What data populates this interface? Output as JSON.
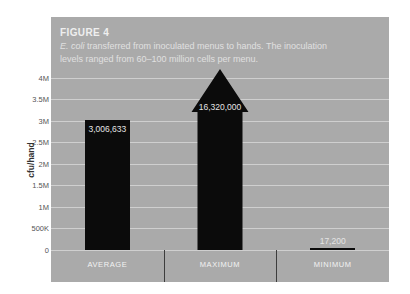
{
  "figure": {
    "label": "FIGURE 4",
    "caption_line1_italic": "E. coli",
    "caption_line1_rest": " transferred from inoculated menus to hands. The inoculation",
    "caption_line2": "levels ranged from 60–100 million cells per menu."
  },
  "colors": {
    "panel_background": "#aaaaaa",
    "bar": "#0b0b0b",
    "gridline": "#cfcfcf",
    "title_text": "#efefef",
    "axis_text": "#555555",
    "divider": "#3d3d3d"
  },
  "chart_data": {
    "type": "bar",
    "title": "FIGURE 4",
    "subtitle": "E. coli transferred from inoculated menus to hands. The inoculation levels ranged from 60–100 million cells per menu.",
    "categories": [
      "AVERAGE",
      "MAXIMUM",
      "MINIMUM"
    ],
    "values": [
      3006633,
      16320000,
      17200
    ],
    "value_labels": [
      "3,006,633",
      "16,320,000",
      "17,200"
    ],
    "xlabel": "",
    "ylabel": "cfu/hand",
    "ylim": [
      0,
      4000000
    ],
    "yticks": [
      0,
      500000,
      1000000,
      1500000,
      2000000,
      2500000,
      3000000,
      3500000,
      4000000
    ],
    "ytick_labels": [
      "0",
      "500K",
      "1M",
      "1.5M",
      "2M",
      "2.5M",
      "3M",
      "3.5M",
      "4M"
    ],
    "grid": true,
    "legend": null,
    "annotations": [
      "MAXIMUM value exceeds axis range and is drawn as an upward arrow"
    ]
  }
}
